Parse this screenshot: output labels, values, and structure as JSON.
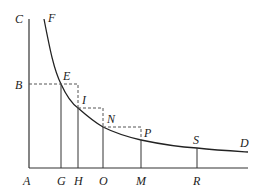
{
  "diagram": {
    "type": "hyperbola-area-construction",
    "colors": {
      "stroke": "#333333",
      "dashed": "#555555",
      "background": "#ffffff"
    },
    "labels": {
      "C": "C",
      "F": "F",
      "B": "B",
      "E": "E",
      "I": "I",
      "N": "N",
      "P": "P",
      "S": "S",
      "D": "D",
      "A": "A",
      "G": "G",
      "H": "H",
      "O": "O",
      "M": "M",
      "R": "R"
    },
    "axes": {
      "vertical": "AC",
      "horizontal": "AD"
    },
    "curve": "FEINPSD",
    "ordinates": [
      "GE",
      "HI",
      "ON",
      "MP",
      "RS"
    ],
    "dashed_segments": [
      "BE",
      "E-H(top)",
      "I-O(top)",
      "N-M(top)"
    ]
  }
}
